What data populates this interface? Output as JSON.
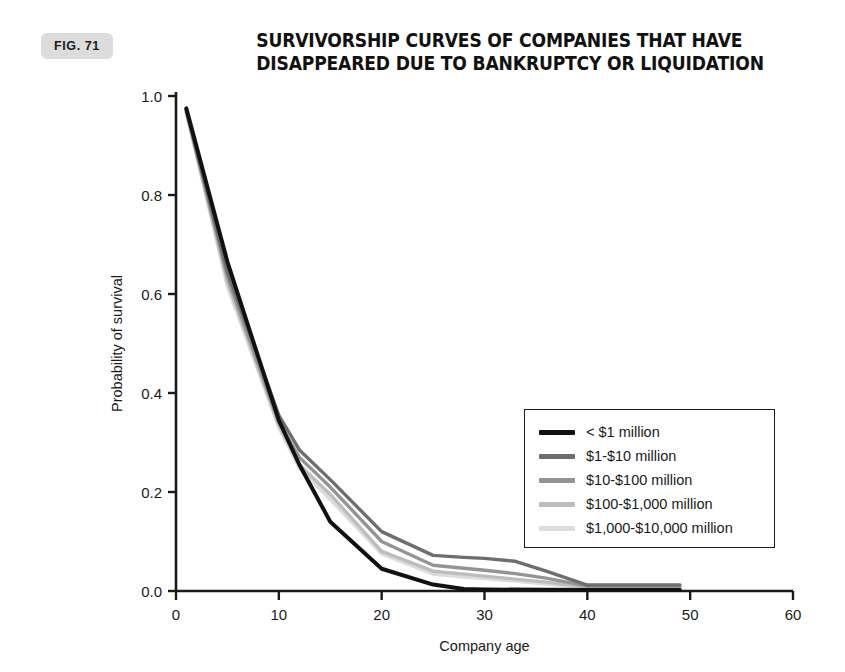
{
  "figure": {
    "badge_label": "FIG. 71"
  },
  "title": {
    "line1": "SURVIVORSHIP CURVES OF COMPANIES THAT HAVE",
    "line2": "DISAPPEARED DUE TO BANKRUPTCY OR LIQUIDATION"
  },
  "chart_data": {
    "type": "line",
    "title": "SURVIVORSHIP CURVES OF COMPANIES THAT HAVE DISAPPEARED DUE TO BANKRUPTCY OR LIQUIDATION",
    "xlabel": "Company age",
    "ylabel": "Probability of survival",
    "xlim": [
      0,
      60
    ],
    "ylim": [
      0.0,
      1.0
    ],
    "xticks": [
      0,
      10,
      20,
      30,
      40,
      50,
      60
    ],
    "yticks": [
      0.0,
      0.2,
      0.4,
      0.6,
      0.8,
      1.0
    ],
    "xtick_labels": [
      "0",
      "10",
      "20",
      "30",
      "40",
      "50",
      "60"
    ],
    "ytick_labels": [
      "0.0",
      "0.2",
      "0.4",
      "0.6",
      "0.8",
      "1.0"
    ],
    "grid": false,
    "legend_position": "center-right",
    "series": [
      {
        "name": "< $1 million",
        "color": "#111111",
        "width": 4.0,
        "x": [
          1,
          5,
          10,
          12,
          15,
          20,
          25,
          28,
          30,
          40,
          49
        ],
        "y": [
          0.975,
          0.665,
          0.345,
          0.255,
          0.14,
          0.045,
          0.013,
          0.004,
          0.003,
          0.002,
          0.002
        ]
      },
      {
        "name": "$1-$10 million",
        "color": "#6e6e6e",
        "width": 3.4,
        "x": [
          1,
          5,
          10,
          12,
          15,
          20,
          25,
          28,
          30,
          33,
          36,
          40,
          49
        ],
        "y": [
          0.972,
          0.645,
          0.355,
          0.285,
          0.225,
          0.12,
          0.072,
          0.068,
          0.066,
          0.06,
          0.04,
          0.012,
          0.012
        ]
      },
      {
        "name": "$10-$100 million",
        "color": "#949494",
        "width": 3.4,
        "x": [
          1,
          5,
          10,
          12,
          15,
          20,
          25,
          28,
          30,
          33,
          36,
          40,
          49
        ],
        "y": [
          0.97,
          0.635,
          0.34,
          0.27,
          0.21,
          0.1,
          0.052,
          0.046,
          0.042,
          0.035,
          0.026,
          0.01,
          0.01
        ]
      },
      {
        "name": "$100-$1,000 million",
        "color": "#bdbdbd",
        "width": 3.4,
        "x": [
          1,
          5,
          10,
          12,
          15,
          20,
          25,
          28,
          30,
          33,
          36,
          40,
          49
        ],
        "y": [
          0.968,
          0.625,
          0.335,
          0.255,
          0.195,
          0.08,
          0.04,
          0.034,
          0.03,
          0.024,
          0.018,
          0.008,
          0.008
        ]
      },
      {
        "name": "$1,000-$10,000 million",
        "color": "#dcdcdc",
        "width": 3.4,
        "x": [
          1,
          5,
          10,
          12,
          15,
          20,
          25,
          28,
          30,
          33,
          36,
          40,
          49
        ],
        "y": [
          0.966,
          0.615,
          0.33,
          0.248,
          0.185,
          0.075,
          0.034,
          0.028,
          0.025,
          0.02,
          0.014,
          0.006,
          0.006
        ]
      }
    ]
  },
  "legend": {
    "items": [
      {
        "label": "< $1 million",
        "color": "#111111"
      },
      {
        "label": "$1-$10 million",
        "color": "#6e6e6e"
      },
      {
        "label": "$10-$100 million",
        "color": "#949494"
      },
      {
        "label": "$100-$1,000 million",
        "color": "#bdbdbd"
      },
      {
        "label": "$1,000-$10,000 million",
        "color": "#dcdcdc"
      }
    ]
  },
  "axis_color": "#1a1a1a"
}
